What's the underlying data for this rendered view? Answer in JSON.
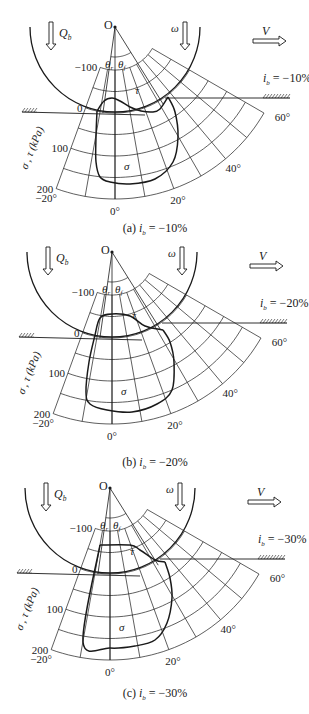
{
  "figure": {
    "width": 309,
    "height": 714,
    "ink_color": "#1a1a1a",
    "background": "#ffffff"
  },
  "common": {
    "center_label": "O",
    "load_label": "Q",
    "load_sub": "b",
    "omega_label": "ω",
    "velocity_label": "V",
    "theta_r_label": "θ",
    "theta_r_sub": "r",
    "theta_f_label": "θ",
    "theta_f_sub": "f",
    "tau_label": "τ",
    "sigma_label": "σ",
    "axis_label": "σ , τ (kPa)",
    "stress_ticks": [
      {
        "value": -100,
        "label": "−100"
      },
      {
        "value": 0,
        "label": "0"
      },
      {
        "value": 100,
        "label": "100"
      },
      {
        "value": 200,
        "label": "200"
      }
    ],
    "angle_ticks": [
      {
        "angle": -20,
        "label": "−20°"
      },
      {
        "angle": 0,
        "label": "0°"
      },
      {
        "angle": 20,
        "label": "20°"
      },
      {
        "angle": 40,
        "label": "40°"
      },
      {
        "angle": 60,
        "label": "60°"
      }
    ],
    "wheel_radius": 85,
    "grid": {
      "r_at_zero": 86,
      "px_per_kpa": 0.43,
      "stress_min": -100,
      "stress_max": 200,
      "stress_step": 50,
      "angle_min": -20,
      "angle_max": 60,
      "angle_step": 10
    },
    "theta_r_angle": -8,
    "theta_f_angle": 32
  },
  "panels": [
    {
      "id": "a",
      "caption_prefix": "(a)",
      "caption_var": "i",
      "caption_sub": "b",
      "caption_value": "= −10%",
      "slip_label_var": "i",
      "slip_label_sub": "b",
      "slip_label_value": "= −10%",
      "origin": [
        115,
        27
      ],
      "caption_y": 232,
      "tau_curve": [
        [
          -18,
          84
        ],
        [
          -11,
          74
        ],
        [
          -3,
          71
        ],
        [
          5,
          74
        ],
        [
          15,
          80
        ],
        [
          26,
          84
        ],
        [
          38,
          85
        ],
        [
          45,
          82
        ],
        [
          53,
          70
        ]
      ],
      "sigma_curve": [
        [
          -18,
          84
        ],
        [
          -19,
          110
        ],
        [
          -19,
          135
        ],
        [
          -15,
          150
        ],
        [
          -5,
          155
        ],
        [
          15,
          157
        ],
        [
          40,
          152
        ],
        [
          58,
          135
        ],
        [
          63,
          110
        ],
        [
          60,
          85
        ],
        [
          53,
          70
        ]
      ]
    },
    {
      "id": "b",
      "caption_prefix": "(b)",
      "caption_var": "i",
      "caption_sub": "b",
      "caption_value": "= −20%",
      "slip_label_var": "i",
      "slip_label_sub": "b",
      "slip_label_value": "= −20%",
      "origin": [
        112,
        252
      ],
      "caption_y": 466,
      "tau_curve": [
        [
          -17,
          83
        ],
        [
          -12,
          66
        ],
        [
          0,
          62
        ],
        [
          18,
          64
        ],
        [
          33,
          74
        ],
        [
          51,
          78
        ]
      ],
      "sigma_curve": [
        [
          -17,
          83
        ],
        [
          -23,
          110
        ],
        [
          -26,
          140
        ],
        [
          -22,
          152
        ],
        [
          -5,
          158
        ],
        [
          20,
          160
        ],
        [
          45,
          152
        ],
        [
          60,
          138
        ],
        [
          62,
          110
        ],
        [
          58,
          90
        ],
        [
          51,
          78
        ]
      ]
    },
    {
      "id": "c",
      "caption_prefix": "(c)",
      "caption_var": "i",
      "caption_sub": "b",
      "caption_value": "= −30%",
      "slip_label_var": "i",
      "slip_label_sub": "b",
      "slip_label_value": "= −30%",
      "origin": [
        110,
        488
      ],
      "caption_y": 697,
      "tau_curve": [
        [
          -10,
          57
        ],
        [
          20,
          57
        ],
        [
          30,
          62
        ],
        [
          45,
          72
        ],
        [
          55,
          74
        ]
      ],
      "sigma_curve": [
        [
          -10,
          57
        ],
        [
          -27,
          154
        ],
        [
          0,
          160
        ],
        [
          25,
          158
        ],
        [
          45,
          152
        ],
        [
          57,
          135
        ],
        [
          62,
          110
        ],
        [
          60,
          90
        ],
        [
          55,
          74
        ]
      ]
    }
  ]
}
